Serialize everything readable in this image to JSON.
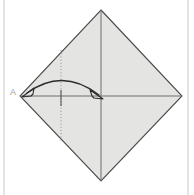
{
  "figure": {
    "title": "Origami fold step diagram",
    "canvas": {
      "width": 194,
      "height": 195,
      "background": "#ffffff"
    },
    "frame": {
      "left_rule_x": 4,
      "right_rule_x": 188,
      "color": "#c8c8c8"
    },
    "paper": {
      "name": "square-sheet-diamond",
      "fill": "#e4e4e2",
      "stroke": "#4a4a4a",
      "stroke_width": 1.1,
      "vertices": {
        "top": {
          "x": 101,
          "y": 10
        },
        "right": {
          "x": 182,
          "y": 96
        },
        "bottom": {
          "x": 101,
          "y": 181
        },
        "left": {
          "x": 20,
          "y": 96
        }
      }
    },
    "creases": [
      {
        "name": "horizontal-crease",
        "style": "solid",
        "color": "#6e6e6e",
        "x1": 20,
        "y1": 96,
        "x2": 182,
        "y2": 96
      },
      {
        "name": "vertical-crease",
        "style": "solid",
        "color": "#6e6e6e",
        "x1": 101,
        "y1": 10,
        "x2": 101,
        "y2": 181
      },
      {
        "name": "quarter-fold-line",
        "style": "dotted",
        "color": "#8d8d8d",
        "x1": 61,
        "y1": 50,
        "x2": 61,
        "y2": 142
      },
      {
        "name": "quarter-fold-tick",
        "style": "solid",
        "color": "#4a4a4a",
        "x1": 61,
        "y1": 90,
        "x2": 61,
        "y2": 106
      }
    ],
    "arrow": {
      "name": "fold-arrow-double-headed",
      "color": "#2b2b2b",
      "stroke_width": 1.3,
      "description": "double-headed curved arrow from left vertex A to center point",
      "start": {
        "x": 26,
        "y": 94
      },
      "end": {
        "x": 100,
        "y": 96
      },
      "control": {
        "x": 63,
        "y": 68
      },
      "head_length": 9,
      "head_width": 6
    },
    "labels": [
      {
        "name": "vertex-label-a",
        "text": "A",
        "x": 10,
        "y": 95,
        "color": "#9a9a9a",
        "font_size": 9
      }
    ]
  }
}
